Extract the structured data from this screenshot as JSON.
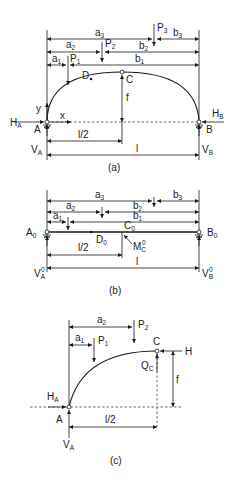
{
  "figure": {
    "panels": [
      {
        "id": "a",
        "caption": "(a)",
        "labels": {
          "a3": "a",
          "a3_sub": "3",
          "a2": "a",
          "a2_sub": "2",
          "a1": "a",
          "a1_sub": "1",
          "b3": "b",
          "b3_sub": "3",
          "b2": "b",
          "b2_sub": "2",
          "b1": "b",
          "b1_sub": "1",
          "P1": "P",
          "P1_sub": "1",
          "P2": "P",
          "P2_sub": "2",
          "P3": "P",
          "P3_sub": "3",
          "D": "D",
          "C": "C",
          "f": "f",
          "y": "y",
          "x": "x",
          "A": "A",
          "B": "B",
          "HA": "H",
          "HA_sub": "A",
          "HB": "H",
          "HB_sub": "B",
          "VA": "V",
          "VA_sub": "A",
          "VB": "V",
          "VB_sub": "B",
          "half_span": "l/2",
          "span": "l"
        }
      },
      {
        "id": "b",
        "caption": "(b)",
        "labels": {
          "a3": "a",
          "a3_sub": "3",
          "a2": "a",
          "a2_sub": "2",
          "a1": "a",
          "a1_sub": "1",
          "b3": "b",
          "b3_sub": "3",
          "b2": "b",
          "b2_sub": "2",
          "b1": "b",
          "b1_sub": "1",
          "A0": "A",
          "A0_sub": "0",
          "B0": "B",
          "B0_sub": "0",
          "C0": "C",
          "C0_sub": "0",
          "D0": "D",
          "D0_sub": "0",
          "MC0": "M",
          "MC0_sub": "C",
          "MC0_sup": "0",
          "VA0": "V",
          "VA0_sub": "A",
          "VA0_sup": "0",
          "VB0": "V",
          "VB0_sub": "B",
          "VB0_sup": "0",
          "half_span": "l/2",
          "span": "l"
        }
      },
      {
        "id": "c",
        "caption": "(c)",
        "labels": {
          "a2": "a",
          "a2_sub": "2",
          "a1": "a",
          "a1_sub": "1",
          "P1": "P",
          "P1_sub": "1",
          "P2": "P",
          "P2_sub": "2",
          "C": "C",
          "H": "H",
          "QC": "Q",
          "QC_sub": "C",
          "f": "f",
          "HA": "H",
          "HA_sub": "A",
          "A": "A",
          "VA": "V",
          "VA_sub": "A",
          "half_span": "l/2"
        }
      }
    ]
  }
}
